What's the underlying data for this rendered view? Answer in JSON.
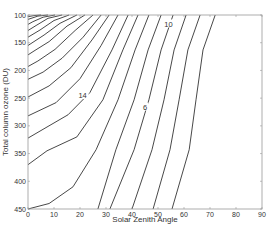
{
  "chart_data": {
    "type": "contour",
    "title": "",
    "xlabel": "Solar Zenith Angle",
    "ylabel": "Total column ozone (DU)",
    "xlim": [
      0,
      90
    ],
    "ylim": [
      450,
      100
    ],
    "y_reversed": true,
    "grid": false,
    "x_ticks": [
      0,
      10,
      20,
      30,
      40,
      50,
      60,
      70,
      80,
      90
    ],
    "y_ticks": [
      100,
      150,
      200,
      250,
      300,
      350,
      400,
      450
    ],
    "contour_labels": [
      {
        "text": "10",
        "x": 54,
        "y": 117
      },
      {
        "text": "14",
        "x": 21,
        "y": 246
      },
      {
        "text": "6",
        "x": 45,
        "y": 267
      }
    ],
    "contours": [
      [
        [
          72.0,
          100
        ],
        [
          67.3,
          163
        ],
        [
          64.6,
          253
        ],
        [
          62.0,
          343
        ],
        [
          55.4,
          450
        ]
      ],
      [
        [
          66.2,
          100
        ],
        [
          61.5,
          163
        ],
        [
          58.1,
          253
        ],
        [
          54.6,
          343
        ],
        [
          48.1,
          450
        ]
      ],
      [
        [
          60.8,
          100
        ],
        [
          56.2,
          163
        ],
        [
          52.3,
          253
        ],
        [
          47.7,
          343
        ],
        [
          40.0,
          450
        ]
      ],
      [
        [
          55.8,
          100
        ],
        [
          51.2,
          163
        ],
        [
          46.5,
          253
        ],
        [
          40.8,
          343
        ],
        [
          31.5,
          450
        ]
      ],
      [
        [
          51.2,
          100
        ],
        [
          46.2,
          163
        ],
        [
          40.8,
          253
        ],
        [
          33.8,
          343
        ],
        [
          26.9,
          450
        ]
      ],
      [
        [
          46.5,
          100
        ],
        [
          41.2,
          163
        ],
        [
          34.6,
          253
        ],
        [
          26.2,
          343
        ],
        [
          17.3,
          410
        ],
        [
          8.1,
          440
        ],
        [
          0,
          450
        ]
      ],
      [
        [
          42.3,
          100
        ],
        [
          36.5,
          163
        ],
        [
          28.8,
          253
        ],
        [
          18.8,
          320
        ],
        [
          7.3,
          345
        ],
        [
          0,
          370
        ]
      ],
      [
        [
          38.5,
          100
        ],
        [
          32.3,
          163
        ],
        [
          23.8,
          240
        ],
        [
          15.4,
          280
        ],
        [
          7.3,
          302
        ],
        [
          0,
          322
        ]
      ],
      [
        [
          34.6,
          100
        ],
        [
          28.1,
          155
        ],
        [
          20.0,
          215
        ],
        [
          10.8,
          258
        ],
        [
          0,
          282
        ]
      ],
      [
        [
          31.2,
          100
        ],
        [
          24.6,
          145
        ],
        [
          16.5,
          195
        ],
        [
          8.1,
          228
        ],
        [
          0,
          248
        ]
      ],
      [
        [
          28.1,
          100
        ],
        [
          21.2,
          140
        ],
        [
          13.1,
          178
        ],
        [
          5.8,
          203
        ],
        [
          0,
          216
        ]
      ],
      [
        [
          25.0,
          100
        ],
        [
          18.1,
          128
        ],
        [
          10.4,
          162
        ],
        [
          3.8,
          183
        ],
        [
          0,
          193
        ]
      ],
      [
        [
          21.9,
          100
        ],
        [
          15.0,
          120
        ],
        [
          8.1,
          148
        ],
        [
          2.3,
          165
        ],
        [
          0,
          172
        ]
      ],
      [
        [
          18.8,
          100
        ],
        [
          12.3,
          115
        ],
        [
          6.2,
          136
        ],
        [
          0,
          155
        ]
      ],
      [
        [
          15.8,
          100
        ],
        [
          10.0,
          110
        ],
        [
          4.6,
          127
        ],
        [
          0,
          140
        ]
      ],
      [
        [
          13.1,
          100
        ],
        [
          7.7,
          106
        ],
        [
          3.1,
          119
        ],
        [
          0,
          128
        ]
      ],
      [
        [
          10.4,
          100
        ],
        [
          5.8,
          104
        ],
        [
          1.9,
          112
        ],
        [
          0,
          117
        ]
      ],
      [
        [
          7.7,
          100
        ],
        [
          3.8,
          102
        ],
        [
          0,
          108
        ]
      ],
      [
        [
          5.0,
          100
        ],
        [
          2.3,
          101
        ],
        [
          0,
          103
        ]
      ]
    ]
  },
  "axes": {
    "xlabel": "Solar Zenith Angle",
    "ylabel": "Total column ozone (DU)",
    "x_tick_labels": [
      "0",
      "10",
      "20",
      "30",
      "40",
      "50",
      "60",
      "70",
      "80",
      "90"
    ],
    "y_tick_labels": [
      "100",
      "150",
      "200",
      "250",
      "300",
      "350",
      "400",
      "450"
    ]
  },
  "colors": {
    "contour": "#333333",
    "axis": "#888888",
    "text": "#333333",
    "background": "#ffffff"
  }
}
